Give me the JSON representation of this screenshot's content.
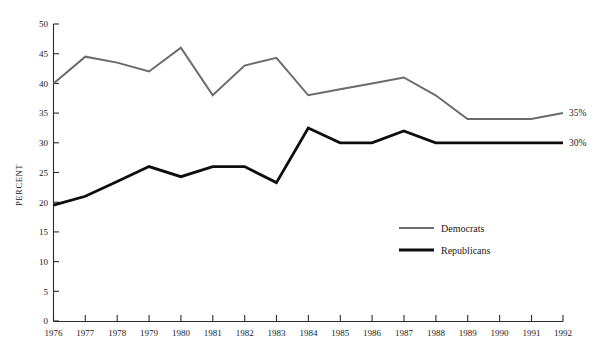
{
  "chart_data": {
    "type": "line",
    "title": "",
    "xlabel": "",
    "ylabel": "PERCENT",
    "xlim": [
      1976,
      1992
    ],
    "ylim": [
      0,
      50
    ],
    "grid": false,
    "legend_position": "center-right-inside",
    "x": [
      1976,
      1977,
      1978,
      1979,
      1980,
      1981,
      1982,
      1983,
      1984,
      1985,
      1986,
      1987,
      1988,
      1989,
      1990,
      1991,
      1992
    ],
    "xticklabels": [
      "1976",
      "1977",
      "1978",
      "1979",
      "1980",
      "1981",
      "1982",
      "1983",
      "1984",
      "1985",
      "1986",
      "1987",
      "1988",
      "1989",
      "1990",
      "1991",
      "1992"
    ],
    "yticks": [
      0,
      5,
      10,
      15,
      20,
      25,
      30,
      35,
      40,
      45,
      50
    ],
    "yticklabels": [
      "0",
      "5",
      "10",
      "15",
      "20",
      "25",
      "30",
      "35",
      "40",
      "45",
      "50"
    ],
    "series": [
      {
        "name": "Democrats",
        "color": "#6b6b6b",
        "line_width": 2.0,
        "values": [
          40,
          44.5,
          43.5,
          42,
          46,
          38,
          43,
          44.3,
          38,
          39,
          40,
          41,
          38,
          34,
          34,
          34,
          35
        ],
        "end_label": "35%"
      },
      {
        "name": "Republicans",
        "color": "#0d0d0d",
        "line_width": 2.8,
        "values": [
          19.5,
          21,
          23.5,
          26,
          24.3,
          26,
          26,
          23.3,
          32.5,
          30,
          30,
          32,
          30,
          30,
          30,
          30,
          30
        ],
        "end_label": "30%"
      }
    ]
  },
  "legend": {
    "items": [
      {
        "label": "Democrats",
        "color": "#6b6b6b",
        "line_width": 2.0
      },
      {
        "label": "Republicans",
        "color": "#0d0d0d",
        "line_width": 2.8
      }
    ]
  },
  "end_labels": [
    {
      "text": "35%",
      "series": "Democrats"
    },
    {
      "text": "30%",
      "series": "Republicans"
    }
  ]
}
